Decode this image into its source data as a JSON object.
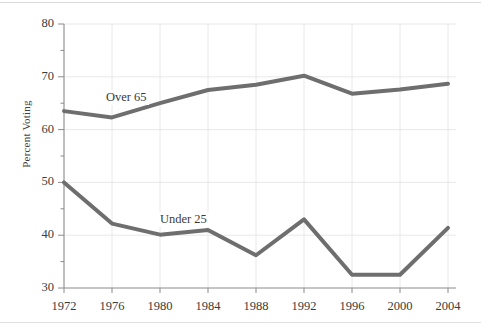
{
  "chart_data": {
    "type": "line",
    "title": "",
    "subtitle": "",
    "xlabel": "",
    "ylabel": "Percent Voting",
    "categories": [
      "1972",
      "1976",
      "1980",
      "1984",
      "1988",
      "1992",
      "1996",
      "2000",
      "2004"
    ],
    "x": [
      1972,
      1976,
      1980,
      1984,
      1988,
      1992,
      1996,
      2000,
      2004
    ],
    "xlim": [
      1972,
      2004
    ],
    "ylim": [
      30,
      80
    ],
    "yticks": [
      30,
      40,
      50,
      60,
      70,
      80
    ],
    "yticks_minor": [
      35,
      45,
      55,
      65,
      75
    ],
    "grid": "both",
    "legend": "inline-labels",
    "series": [
      {
        "name": "Over 65",
        "color": "#6e6e6e",
        "values": [
          63.5,
          62.3,
          65.0,
          67.5,
          68.5,
          70.2,
          66.8,
          67.6,
          68.7
        ],
        "label_text": "Over 65"
      },
      {
        "name": "Under 25",
        "color": "#6e6e6e",
        "values": [
          50.0,
          42.2,
          40.1,
          41.0,
          36.2,
          43.0,
          32.5,
          32.5,
          41.4
        ],
        "label_text": "Under 25"
      }
    ],
    "annotations": [
      "Over 65",
      "Under 25"
    ]
  },
  "style": {
    "line_color": "#6e6e6e",
    "grid_color": "#e8e8e8",
    "axis_color": "#8a8a8a",
    "text_color": "#3b3b3b",
    "background": "#ffffff",
    "line_width": 4
  }
}
